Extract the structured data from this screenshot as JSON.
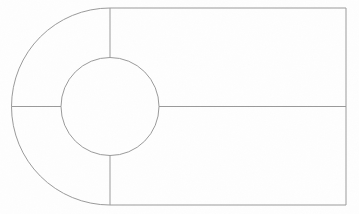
{
  "canvas": {
    "width": 359,
    "height": 214,
    "background_color": "#fefefe",
    "stroke_color": "#9a9a9a",
    "stroke_width": 1,
    "fill_color": "none",
    "title": "Technical line drawing"
  },
  "diagram": {
    "name": "keyhole-slot-outline",
    "geometry": {
      "outer_arc": {
        "name": "outer-semicircle-left",
        "center_x": 110,
        "center_y": 106.5,
        "radius": 98.5,
        "start_angle_deg": 90,
        "end_angle_deg": 270,
        "sweep": "left"
      },
      "inner_circle": {
        "name": "center-circle",
        "center_x": 110,
        "center_y": 106.5,
        "radius": 49
      },
      "rectangle": {
        "name": "right-rectangle",
        "left_x": 110,
        "right_x": 346,
        "top_y": 8,
        "bottom_y": 205,
        "width": 236,
        "height": 197
      },
      "spokes": [
        {
          "name": "spoke-top",
          "x1": 110,
          "y1": 8,
          "x2": 110,
          "y2": 57.5,
          "orientation": "vertical"
        },
        {
          "name": "spoke-left",
          "x1": 11.5,
          "y1": 106.5,
          "x2": 61,
          "y2": 106.5,
          "orientation": "horizontal"
        },
        {
          "name": "spoke-bottom",
          "x1": 110,
          "y1": 155.5,
          "x2": 110,
          "y2": 205,
          "orientation": "vertical"
        },
        {
          "name": "spoke-right",
          "x1": 159,
          "y1": 106.5,
          "x2": 346,
          "y2": 106.5,
          "orientation": "horizontal"
        }
      ]
    },
    "regions": [
      {
        "name": "region-upper-left-arc",
        "label": ""
      },
      {
        "name": "region-lower-left-arc",
        "label": ""
      },
      {
        "name": "region-upper-right",
        "label": ""
      },
      {
        "name": "region-lower-right",
        "label": ""
      },
      {
        "name": "region-center-circle",
        "label": ""
      }
    ]
  }
}
